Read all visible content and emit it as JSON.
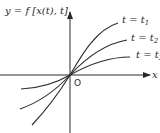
{
  "diagram": {
    "y_axis_label": "y = f [x(t), t]",
    "x_axis_label": "x",
    "origin_label": "O",
    "curves": [
      {
        "label_prefix": "t = t",
        "label_sub": "1"
      },
      {
        "label_prefix": "t = t",
        "label_sub": "2"
      },
      {
        "label_prefix": "t = t",
        "label_sub": "3"
      }
    ],
    "colors": {
      "line": "#2a2a2a",
      "background": "#ffffff"
    }
  }
}
